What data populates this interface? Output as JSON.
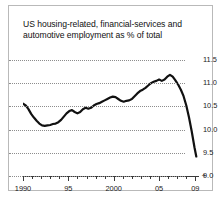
{
  "chart_data": {
    "type": "line",
    "title": "US housing-related, financial-services and automotive employment as % of total",
    "xlabel": "",
    "ylabel": "",
    "xlim": [
      1990,
      2009.4
    ],
    "ylim": [
      9.0,
      11.5
    ],
    "yticks": [
      9.0,
      9.5,
      10.0,
      10.5,
      11.0,
      11.5
    ],
    "ytick_labels": [
      "9.0",
      "9.5",
      "10.0",
      "10.5",
      "11.0",
      "11.5"
    ],
    "ytick_side": "right",
    "xticks": [
      1990,
      1995,
      2000,
      2005,
      2009
    ],
    "xtick_labels": [
      "1990",
      "95",
      "2000",
      "05",
      "09"
    ],
    "xtick_minor_step": 1,
    "grid": "horizontal-dotted",
    "legend": "none",
    "line_color": "#111111",
    "line_width": 2.2,
    "x": [
      1990.0,
      1990.3,
      1990.6,
      1990.9,
      1991.2,
      1991.5,
      1991.8,
      1992.1,
      1992.4,
      1992.7,
      1993.0,
      1993.3,
      1993.6,
      1993.9,
      1994.2,
      1994.5,
      1994.8,
      1995.1,
      1995.4,
      1995.7,
      1996.0,
      1996.3,
      1996.6,
      1996.9,
      1997.2,
      1997.5,
      1997.8,
      1998.1,
      1998.4,
      1998.7,
      1999.0,
      1999.3,
      1999.6,
      1999.9,
      2000.2,
      2000.5,
      2000.8,
      2001.1,
      2001.4,
      2001.7,
      2002.0,
      2002.3,
      2002.6,
      2002.9,
      2003.2,
      2003.5,
      2003.8,
      2004.1,
      2004.4,
      2004.7,
      2005.0,
      2005.3,
      2005.6,
      2005.9,
      2006.2,
      2006.5,
      2006.8,
      2007.1,
      2007.4,
      2007.7,
      2008.0,
      2008.3,
      2008.6,
      2008.9,
      2009.1
    ],
    "values": [
      10.56,
      10.52,
      10.44,
      10.34,
      10.26,
      10.19,
      10.13,
      10.09,
      10.08,
      10.09,
      10.1,
      10.12,
      10.13,
      10.16,
      10.21,
      10.28,
      10.35,
      10.4,
      10.42,
      10.38,
      10.35,
      10.38,
      10.44,
      10.47,
      10.45,
      10.47,
      10.52,
      10.55,
      10.57,
      10.6,
      10.63,
      10.66,
      10.69,
      10.71,
      10.7,
      10.66,
      10.62,
      10.6,
      10.62,
      10.63,
      10.66,
      10.72,
      10.78,
      10.83,
      10.86,
      10.9,
      10.95,
      11.0,
      11.03,
      11.05,
      11.08,
      11.05,
      11.08,
      11.14,
      11.18,
      11.14,
      11.06,
      10.97,
      10.86,
      10.72,
      10.52,
      10.26,
      9.96,
      9.62,
      9.42
    ],
    "source_mark": "✦"
  }
}
